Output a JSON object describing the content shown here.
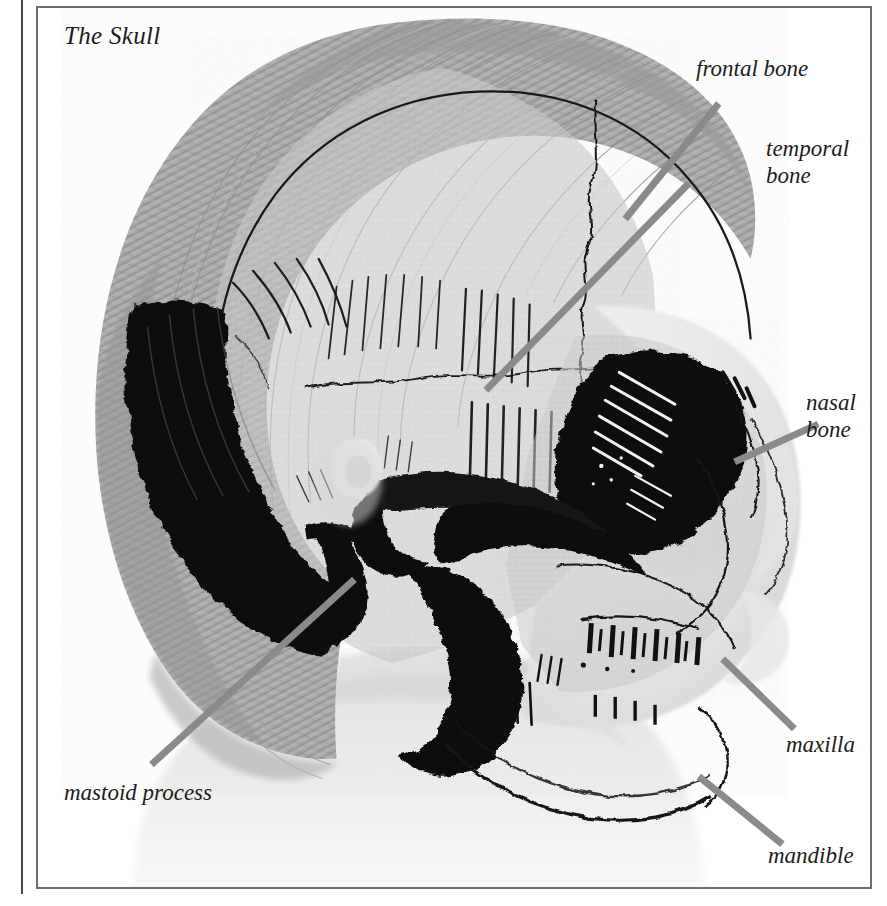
{
  "plate": {
    "title": "The Skull",
    "background_color": "#ffffff",
    "frame_color": "#6e6e6e",
    "text_color": "#1c1c1c",
    "leader_line_color": "#8a8a8a"
  },
  "labels": [
    {
      "id": "frontal-bone",
      "text": "frontal bone",
      "lines": 1
    },
    {
      "id": "temporal-bone",
      "text": "temporal\nbone",
      "lines": 2
    },
    {
      "id": "nasal-bone",
      "text": "nasal\nbone",
      "lines": 2
    },
    {
      "id": "maxilla",
      "text": "maxilla",
      "lines": 1
    },
    {
      "id": "mandible",
      "text": "mandible",
      "lines": 1
    },
    {
      "id": "mastoid-process",
      "text": "mastoid process",
      "lines": 1
    }
  ],
  "illustration": {
    "subject": "lateral view of a human head with skull bones superimposed over a photographic profile",
    "style": "engraved line illustration, grayscale",
    "hair_tone": "#a8a8a8",
    "bone_tone": "#c9c9c9",
    "skin_tone": "#ededed",
    "ink_color": "#111111"
  }
}
